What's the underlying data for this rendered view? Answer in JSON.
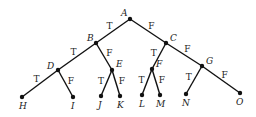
{
  "diagram": {
    "type": "binary-decision-tree",
    "root": "A",
    "nodes": [
      {
        "id": "A",
        "label": "A",
        "x": 130,
        "y": 19,
        "lx": -9,
        "ly": -3
      },
      {
        "id": "B",
        "label": "B",
        "x": 96,
        "y": 43,
        "lx": -9,
        "ly": -2
      },
      {
        "id": "C",
        "label": "C",
        "x": 166,
        "y": 43,
        "lx": 4,
        "ly": -2
      },
      {
        "id": "D",
        "label": "D",
        "x": 58,
        "y": 70,
        "lx": -11,
        "ly": -1
      },
      {
        "id": "E",
        "label": "E",
        "x": 112,
        "y": 70,
        "lx": 4,
        "ly": -3
      },
      {
        "id": "F",
        "label": "F",
        "x": 152,
        "y": 69,
        "lx": 4,
        "ly": -2
      },
      {
        "id": "G",
        "label": "G",
        "x": 202,
        "y": 66,
        "lx": 4,
        "ly": -2
      },
      {
        "id": "H",
        "label": "H",
        "x": 22,
        "y": 97,
        "lx": -3,
        "ly": 12
      },
      {
        "id": "I",
        "label": "I",
        "x": 73,
        "y": 97,
        "lx": -2,
        "ly": 12
      },
      {
        "id": "J",
        "label": "J",
        "x": 101,
        "y": 96,
        "lx": -3,
        "ly": 12
      },
      {
        "id": "K",
        "label": "K",
        "x": 120,
        "y": 96,
        "lx": -3,
        "ly": 12
      },
      {
        "id": "L",
        "label": "L",
        "x": 142,
        "y": 95,
        "lx": -3,
        "ly": 12
      },
      {
        "id": "M",
        "label": "M",
        "x": 160,
        "y": 95,
        "lx": -4,
        "ly": 12
      },
      {
        "id": "N",
        "label": "N",
        "x": 186,
        "y": 94,
        "lx": -4,
        "ly": 12
      },
      {
        "id": "O",
        "label": "O",
        "x": 240,
        "y": 93,
        "lx": -4,
        "ly": 12
      }
    ],
    "edges": [
      {
        "from": "A",
        "to": "B",
        "label": "T"
      },
      {
        "from": "A",
        "to": "C",
        "label": "F"
      },
      {
        "from": "B",
        "to": "D",
        "label": "T"
      },
      {
        "from": "B",
        "to": "E",
        "label": "F"
      },
      {
        "from": "C",
        "to": "F",
        "label": "T"
      },
      {
        "from": "C",
        "to": "G",
        "label": "F"
      },
      {
        "from": "D",
        "to": "H",
        "label": "T"
      },
      {
        "from": "D",
        "to": "I",
        "label": "F"
      },
      {
        "from": "E",
        "to": "J",
        "label": "T"
      },
      {
        "from": "E",
        "to": "K",
        "label": "F"
      },
      {
        "from": "F",
        "to": "L",
        "label": "T"
      },
      {
        "from": "F",
        "to": "M",
        "label": "F"
      },
      {
        "from": "G",
        "to": "N",
        "label": "T"
      },
      {
        "from": "G",
        "to": "O",
        "label": "F"
      }
    ],
    "colors": {
      "line": "#111111",
      "background": "#ffffff"
    }
  }
}
